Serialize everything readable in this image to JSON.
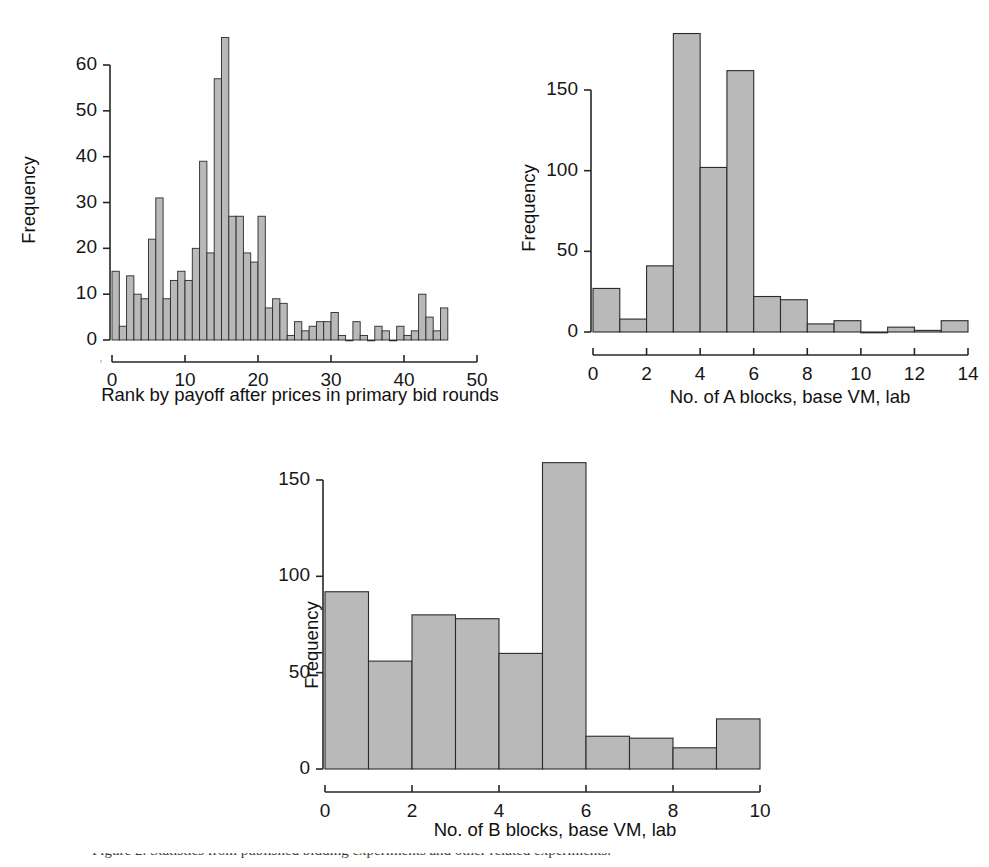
{
  "figure": {
    "background": "#ffffff",
    "bar_fill": "#b9b9b9",
    "bar_stroke": "#2b2b2b",
    "axis_color": "#262626",
    "caption": "Figure 2. Statistics from published bidding experiments and other related experiments."
  },
  "chart_data": [
    {
      "id": "rank-by-payoff",
      "type": "bar",
      "title": "",
      "xlabel": "Rank by payoff after prices in primary bid rounds",
      "ylabel": "Frequency",
      "xlim": [
        0,
        50
      ],
      "ylim": [
        0,
        67
      ],
      "xticks": [
        0,
        10,
        20,
        30,
        40,
        50
      ],
      "yticks": [
        0,
        10,
        20,
        30,
        40,
        50,
        60
      ],
      "xtick_labels": [
        "0",
        "10",
        "20",
        "30",
        "40",
        "50"
      ],
      "ytick_labels": [
        "0",
        "10",
        "20",
        "30",
        "40",
        "50",
        "60"
      ],
      "bin_width": 1,
      "grid": false,
      "legend": "none",
      "categories": [
        0,
        1,
        2,
        3,
        4,
        5,
        6,
        7,
        8,
        9,
        10,
        11,
        12,
        13,
        14,
        15,
        16,
        17,
        18,
        19,
        20,
        21,
        22,
        23,
        24,
        25,
        26,
        27,
        28,
        29,
        30,
        31,
        32,
        33,
        34,
        35,
        36,
        37,
        38,
        39,
        40,
        41,
        42,
        43,
        44,
        45,
        46,
        47,
        48,
        49
      ],
      "values": [
        15,
        3,
        14,
        10,
        9,
        22,
        31,
        9,
        13,
        15,
        13,
        20,
        39,
        19,
        57,
        66,
        27,
        27,
        19,
        17,
        27,
        7,
        9,
        8,
        1,
        4,
        2,
        3,
        4,
        4,
        6,
        1,
        0,
        4,
        1,
        0,
        3,
        2,
        0,
        3,
        1,
        2,
        10,
        5,
        2,
        7
      ]
    },
    {
      "id": "a-blocks",
      "type": "bar",
      "title": "",
      "xlabel": "No. of A blocks, base VM, lab",
      "ylabel": "Frequency",
      "xlim": [
        0,
        14
      ],
      "ylim": [
        0,
        190
      ],
      "xticks": [
        0,
        2,
        4,
        6,
        8,
        10,
        12,
        14
      ],
      "yticks": [
        0,
        50,
        100,
        150
      ],
      "xtick_labels": [
        "0",
        "2",
        "4",
        "6",
        "8",
        "10",
        "12",
        "14"
      ],
      "ytick_labels": [
        "0",
        "50",
        "100",
        "150"
      ],
      "bin_width": 1,
      "grid": false,
      "legend": "none",
      "categories": [
        0,
        1,
        2,
        3,
        4,
        5,
        6,
        7,
        8,
        9,
        10,
        11,
        12,
        13
      ],
      "values": [
        27,
        8,
        41,
        185,
        102,
        162,
        22,
        20,
        5,
        7,
        0,
        3,
        1,
        7
      ]
    },
    {
      "id": "b-blocks",
      "type": "bar",
      "title": "",
      "xlabel": "No. of B blocks, base VM, lab",
      "ylabel": "Frequency",
      "xlim": [
        0,
        10
      ],
      "ylim": [
        0,
        168
      ],
      "xticks": [
        0,
        2,
        4,
        6,
        8,
        10
      ],
      "yticks": [
        0,
        50,
        100,
        150
      ],
      "xtick_labels": [
        "0",
        "2",
        "4",
        "6",
        "8",
        "10"
      ],
      "ytick_labels": [
        "0",
        "50",
        "100",
        "150"
      ],
      "bin_width": 1,
      "grid": false,
      "legend": "none",
      "categories": [
        0,
        1,
        2,
        3,
        4,
        5,
        6,
        7,
        8,
        9
      ],
      "values": [
        92,
        56,
        80,
        78,
        60,
        159,
        17,
        16,
        11,
        26
      ]
    }
  ]
}
